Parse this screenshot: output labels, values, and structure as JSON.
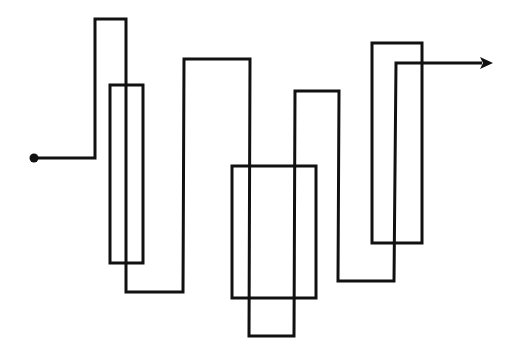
{
  "diagram": {
    "width": 522,
    "height": 359,
    "background": "#ffffff",
    "stroke_color": "#111111",
    "stroke_width": 3,
    "start_dot": {
      "cx": 34,
      "cy": 158,
      "r": 4.5
    },
    "path_points": [
      [
        34,
        158
      ],
      [
        95,
        158
      ],
      [
        95,
        19
      ],
      [
        126,
        19
      ],
      [
        126,
        292
      ],
      [
        183,
        292
      ],
      [
        184,
        59
      ],
      [
        250,
        59
      ],
      [
        249,
        336
      ],
      [
        294,
        336
      ],
      [
        295,
        91
      ],
      [
        339,
        91
      ],
      [
        338,
        281
      ],
      [
        394,
        281
      ],
      [
        396,
        63
      ],
      [
        482,
        63
      ]
    ],
    "arrow_head": {
      "tip": [
        493,
        63
      ],
      "length": 13,
      "half_width": 6
    },
    "rectangles": [
      {
        "name": "rect-left",
        "x": 110,
        "y": 85,
        "width": 33,
        "height": 178
      },
      {
        "name": "rect-center",
        "x": 232,
        "y": 166,
        "width": 84,
        "height": 132
      },
      {
        "name": "rect-right",
        "x": 372,
        "y": 43,
        "width": 50,
        "height": 200
      }
    ]
  }
}
